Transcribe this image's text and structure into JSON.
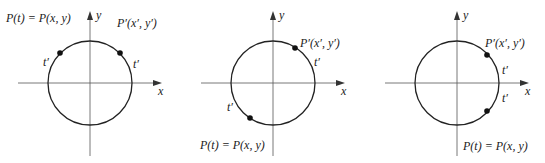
{
  "panels": [
    {
      "id": "panel-1",
      "center": [
        90,
        83
      ],
      "radius": 42,
      "axis_x_label": "x",
      "axis_y_label": "y",
      "p_label": "P(t) = P(x, y)",
      "p_label_pos": [
        6,
        22
      ],
      "pprime_label": "P′(x′, y′)",
      "pprime_label_pos": [
        117,
        27
      ],
      "points": [
        [
          60,
          53
        ],
        [
          120,
          53
        ]
      ],
      "t_labels": [
        {
          "text": "t′",
          "pos": [
            43,
            66
          ]
        },
        {
          "text": "t′",
          "pos": [
            133,
            68
          ]
        }
      ]
    },
    {
      "id": "panel-2",
      "center": [
        273,
        83
      ],
      "radius": 42,
      "axis_x_label": "x",
      "axis_y_label": "y",
      "p_label": "P(t) = P(x, y)",
      "p_label_pos": [
        200,
        149
      ],
      "pprime_label": "P′(x′, y′)",
      "pprime_label_pos": [
        300,
        47
      ],
      "points": [
        [
          295,
          48
        ],
        [
          250,
          118
        ]
      ],
      "t_labels": [
        {
          "text": "t′",
          "pos": [
            314,
            66
          ]
        },
        {
          "text": "t′",
          "pos": [
            227,
            111
          ]
        }
      ]
    },
    {
      "id": "panel-3",
      "center": [
        457,
        83
      ],
      "radius": 42,
      "axis_x_label": "x",
      "axis_y_label": "y",
      "p_label": "P(t) = P(x, y)",
      "p_label_pos": [
        463,
        150
      ],
      "pprime_label": "P′(x′, y′)",
      "pprime_label_pos": [
        485,
        47
      ],
      "points": [
        [
          487,
          55
        ],
        [
          487,
          111
        ]
      ],
      "t_labels": [
        {
          "text": "t′",
          "pos": [
            502,
            74
          ]
        },
        {
          "text": "t′",
          "pos": [
            502,
            102
          ]
        }
      ]
    }
  ],
  "colors": {
    "stroke": "#222222",
    "axis": "#555555",
    "background": "#ffffff"
  }
}
